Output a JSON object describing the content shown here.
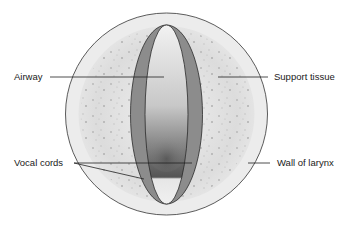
{
  "diagram": {
    "labels": {
      "airway": "Airway",
      "support_tissue": "Support tissue",
      "vocal_cords": "Vocal cords",
      "wall_of_larynx": "Wall of larynx"
    },
    "colors": {
      "wall": "#ececec",
      "support_tissue": "#d9d9d9",
      "vocal_cord": "#8c8c8c",
      "airway_light": "#e8e8e8",
      "airway_dark": "#5a5a5a",
      "outline": "#333333",
      "leader_line": "#222222"
    }
  }
}
